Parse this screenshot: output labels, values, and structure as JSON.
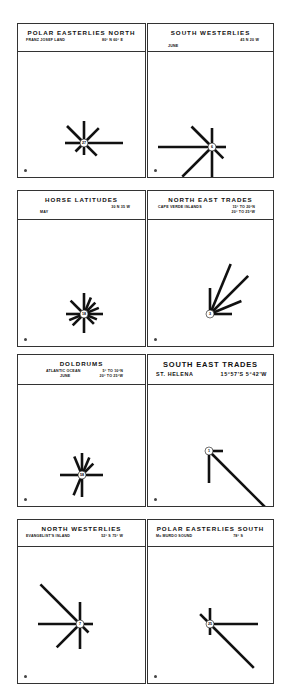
{
  "panels": [
    {
      "id": "polar-easterlies-north",
      "title": "POLAR EASTERLIES NORTH",
      "location": "FRANZ JOSEF LAND",
      "coords": "80° N   60° E",
      "extra": "",
      "calm_pct": "27",
      "box": {
        "x": 17,
        "y": 23,
        "w": 129,
        "h": 155
      },
      "header_h": 28,
      "center": {
        "x": 66,
        "y": 91
      },
      "arms": [
        {
          "dir": "N",
          "len": 18
        },
        {
          "dir": "NE",
          "len": 17
        },
        {
          "dir": "E",
          "len": 35
        },
        {
          "dir": "SE",
          "len": 14
        },
        {
          "dir": "S",
          "len": 8
        },
        {
          "dir": "SW",
          "len": 8
        },
        {
          "dir": "W",
          "len": 15
        },
        {
          "dir": "NW",
          "len": 20
        }
      ]
    },
    {
      "id": "south-westerlies",
      "title": "SOUTH WESTERLIES",
      "location": "",
      "coords": "45 N   20 W",
      "extra": "JUNE",
      "calm_pct": "6",
      "box": {
        "x": 147,
        "y": 23,
        "w": 127,
        "h": 155
      },
      "header_h": 28,
      "center": {
        "x": 64,
        "y": 95
      },
      "arms": [
        {
          "dir": "N",
          "len": 15
        },
        {
          "dir": "NE",
          "len": 0
        },
        {
          "dir": "E",
          "len": 10
        },
        {
          "dir": "SE",
          "len": 12
        },
        {
          "dir": "S",
          "len": 28
        },
        {
          "dir": "SW",
          "len": 38
        },
        {
          "dir": "W",
          "len": 50
        },
        {
          "dir": "NW",
          "len": 25
        }
      ]
    },
    {
      "id": "horse-latitudes",
      "title": "HORSE LATITUDES",
      "location": "MAY",
      "coords": "30 N   35 W",
      "extra": "",
      "calm_pct": "18",
      "box": {
        "x": 17,
        "y": 190,
        "w": 129,
        "h": 157
      },
      "header_h": 29,
      "center": {
        "x": 66,
        "y": 94
      },
      "arms": [
        {
          "dir": "N",
          "len": 17
        },
        {
          "dir": "NNE",
          "len": 14
        },
        {
          "dir": "NE",
          "len": 12
        },
        {
          "dir": "ENE",
          "len": 12
        },
        {
          "dir": "E",
          "len": 15
        },
        {
          "dir": "ESE",
          "len": 10
        },
        {
          "dir": "SE",
          "len": 10
        },
        {
          "dir": "S",
          "len": 15
        },
        {
          "dir": "SW",
          "len": 12
        },
        {
          "dir": "WSW",
          "len": 12
        },
        {
          "dir": "W",
          "len": 14
        },
        {
          "dir": "NW",
          "len": 15
        }
      ]
    },
    {
      "id": "north-east-trades",
      "title": "NORTH EAST TRADES",
      "location": "CAPE VERDE ISLANDS",
      "coords": "15° TO 20°N",
      "extra": "20° TO 25°W",
      "calm_pct": "3",
      "box": {
        "x": 147,
        "y": 190,
        "w": 127,
        "h": 157
      },
      "header_h": 29,
      "center": {
        "x": 62,
        "y": 94
      },
      "arms": [
        {
          "dir": "N",
          "len": 22
        },
        {
          "dir": "NNE",
          "len": 50
        },
        {
          "dir": "NE",
          "len": 50
        },
        {
          "dir": "ENE",
          "len": 30
        },
        {
          "dir": "E",
          "len": 18
        }
      ]
    },
    {
      "id": "doldrums",
      "title": "DOLDRUMS",
      "location": "ATLANTIC OCEAN",
      "coords": "5° TO 10°N",
      "extra": "JUNE",
      "extra2": "20° TO 25°W",
      "calm_pct": "58",
      "box": {
        "x": 17,
        "y": 354,
        "w": 129,
        "h": 153
      },
      "header_h": 30,
      "center": {
        "x": 64,
        "y": 90
      },
      "arms": [
        {
          "dir": "N",
          "len": 18
        },
        {
          "dir": "NNE",
          "len": 15
        },
        {
          "dir": "NE",
          "len": 12
        },
        {
          "dir": "E",
          "len": 17
        },
        {
          "dir": "S",
          "len": 18
        },
        {
          "dir": "SSW",
          "len": 18
        },
        {
          "dir": "W",
          "len": 18
        },
        {
          "dir": "NNW",
          "len": 16
        }
      ]
    },
    {
      "id": "south-east-trades",
      "title": "SOUTH EAST TRADES",
      "location": "ST. HELENA",
      "coords": "15°57'S  5°42'W",
      "extra": "",
      "calm_pct": "1",
      "box": {
        "x": 147,
        "y": 354,
        "w": 127,
        "h": 153
      },
      "header_h": 30,
      "center": {
        "x": 61,
        "y": 66
      },
      "arms": [
        {
          "dir": "E",
          "len": 10
        },
        {
          "dir": "S",
          "len": 28
        },
        {
          "dir": "SE",
          "len": 85
        }
      ]
    },
    {
      "id": "north-westerlies",
      "title": "NORTH WESTERLIES",
      "location": "EVANGELIST'S ISLAND",
      "coords": "52° S   75° W",
      "extra": "",
      "calm_pct": "7",
      "box": {
        "x": 17,
        "y": 519,
        "w": 129,
        "h": 165
      },
      "header_h": 27,
      "center": {
        "x": 62,
        "y": 77
      },
      "arms": [
        {
          "dir": "N",
          "len": 18
        },
        {
          "dir": "E",
          "len": 9
        },
        {
          "dir": "SE",
          "len": 8
        },
        {
          "dir": "S",
          "len": 21
        },
        {
          "dir": "SW",
          "len": 29
        },
        {
          "dir": "W",
          "len": 38
        },
        {
          "dir": "NW",
          "len": 52
        }
      ]
    },
    {
      "id": "polar-easterlies-south",
      "title": "POLAR EASTERLIES SOUTH",
      "location": "Mc MURDO SOUND",
      "coords": "78° S",
      "extra": "",
      "calm_pct": "25",
      "box": {
        "x": 147,
        "y": 519,
        "w": 127,
        "h": 165
      },
      "header_h": 27,
      "center": {
        "x": 62,
        "y": 77
      },
      "arms": [
        {
          "dir": "N",
          "len": 12
        },
        {
          "dir": "E",
          "len": 44
        },
        {
          "dir": "SE",
          "len": 58
        },
        {
          "dir": "S",
          "len": 7
        },
        {
          "dir": "NW",
          "len": 10
        }
      ]
    }
  ],
  "figure_labels": [
    "1",
    "2",
    "3",
    "4",
    "5",
    "6",
    "7",
    "8"
  ],
  "colors": {
    "ink": "#111111",
    "frame": "#333333",
    "paper": "#ffffff"
  }
}
